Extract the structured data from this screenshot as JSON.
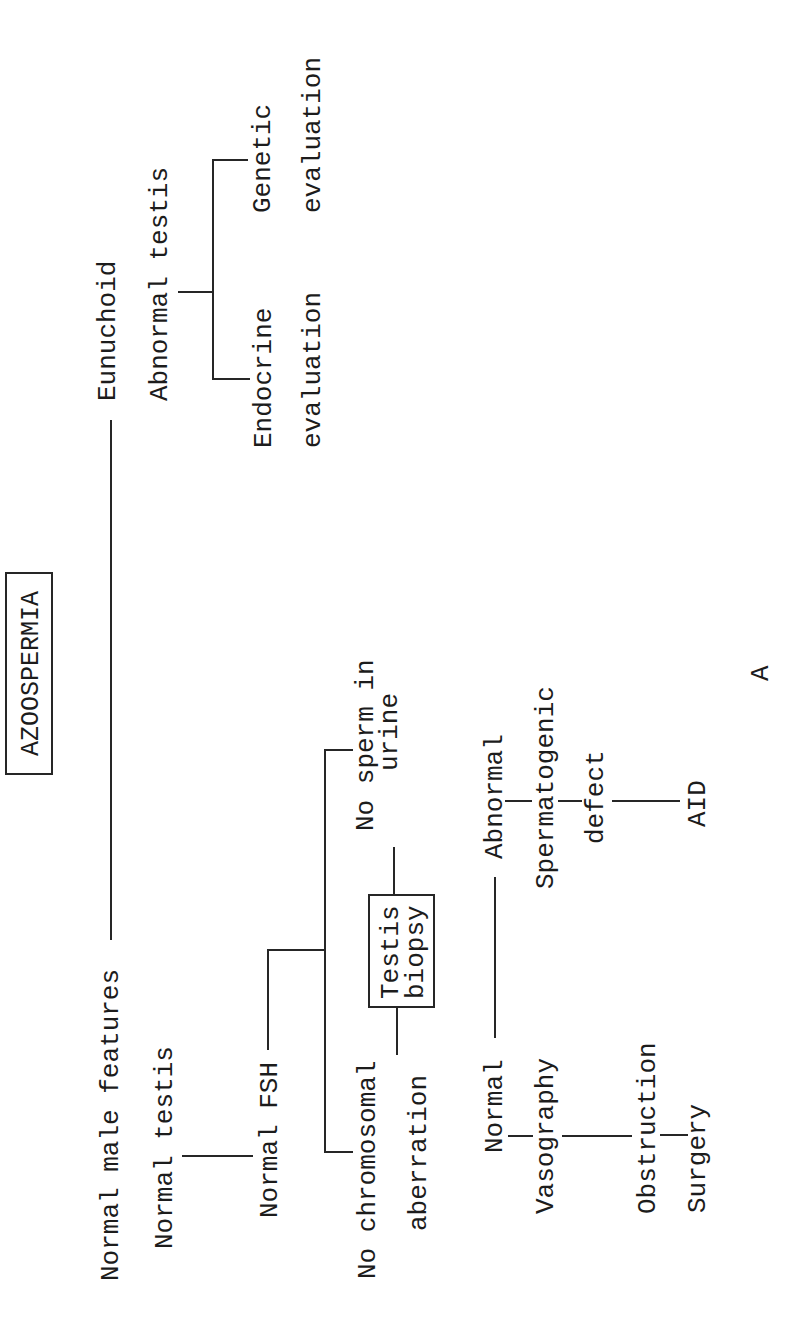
{
  "diagram": {
    "title": "AZOOSPERMIA",
    "figure_label": "A",
    "orientation": "rotated 90° counter-clockwise (text reads bottom-to-top)",
    "nodes": [
      {
        "id": "normal_male_features",
        "lines": [
          "Normal male features"
        ]
      },
      {
        "id": "eunuchoid",
        "lines": [
          "Eunuchoid"
        ]
      },
      {
        "id": "abnormal_testis",
        "lines": [
          "Abnormal testis"
        ]
      },
      {
        "id": "endocrine_evaluation",
        "lines": [
          "Endocrine",
          "evaluation"
        ]
      },
      {
        "id": "genetic_evaluation",
        "lines": [
          "Genetic",
          "evaluation"
        ]
      },
      {
        "id": "normal_testis",
        "lines": [
          "Normal testis"
        ]
      },
      {
        "id": "normal_fsh",
        "lines": [
          "Normal FSH"
        ]
      },
      {
        "id": "no_chromosomal_aberration",
        "lines": [
          "No chromosomal",
          "aberration"
        ]
      },
      {
        "id": "no_sperm_in_urine",
        "lines": [
          "No sperm in",
          "urine"
        ]
      },
      {
        "id": "testis_biopsy",
        "lines": [
          "Testis",
          "biopsy"
        ]
      },
      {
        "id": "biopsy_normal",
        "lines": [
          "Normal"
        ]
      },
      {
        "id": "biopsy_abnormal",
        "lines": [
          "Abnormal"
        ]
      },
      {
        "id": "vasography",
        "lines": [
          "Vasography"
        ]
      },
      {
        "id": "obstruction",
        "lines": [
          "Obstruction"
        ]
      },
      {
        "id": "surgery",
        "lines": [
          "Surgery"
        ]
      },
      {
        "id": "spermatogenic_defect",
        "lines": [
          "Spermatogenic",
          "defect"
        ]
      },
      {
        "id": "aid",
        "lines": [
          "AID"
        ]
      }
    ],
    "edges": [
      {
        "from": "title",
        "to": "normal_male_features"
      },
      {
        "from": "title",
        "to": "eunuchoid"
      },
      {
        "from": "eunuchoid",
        "to": "abnormal_testis"
      },
      {
        "from": "abnormal_testis",
        "to": "endocrine_evaluation"
      },
      {
        "from": "abnormal_testis",
        "to": "genetic_evaluation"
      },
      {
        "from": "normal_male_features",
        "to": "normal_testis"
      },
      {
        "from": "normal_testis",
        "to": "normal_fsh"
      },
      {
        "from": "normal_fsh",
        "to": "no_chromosomal_aberration"
      },
      {
        "from": "normal_fsh",
        "to": "no_sperm_in_urine"
      },
      {
        "from": "no_chromosomal_aberration",
        "to": "testis_biopsy"
      },
      {
        "from": "no_sperm_in_urine",
        "to": "testis_biopsy"
      },
      {
        "from": "testis_biopsy",
        "to": "biopsy_normal"
      },
      {
        "from": "testis_biopsy",
        "to": "biopsy_abnormal"
      },
      {
        "from": "biopsy_normal",
        "to": "vasography"
      },
      {
        "from": "vasography",
        "to": "obstruction"
      },
      {
        "from": "obstruction",
        "to": "surgery"
      },
      {
        "from": "biopsy_abnormal",
        "to": "spermatogenic_defect"
      },
      {
        "from": "spermatogenic_defect",
        "to": "aid"
      }
    ],
    "colors": {
      "background": "#ffffff",
      "text": "#1c1c1c",
      "lines": "#262626"
    }
  }
}
